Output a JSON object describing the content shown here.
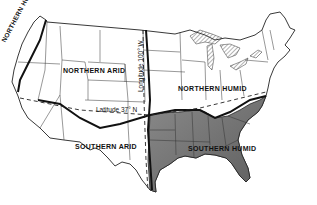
{
  "map": {
    "regions": [
      {
        "name": "Northern Humid",
        "label": "NORTHERN HUMID",
        "position": "Pacific Northwest coast strip"
      },
      {
        "name": "Northern Arid",
        "label": "NORTHERN ARID",
        "position": "north-west interior"
      },
      {
        "name": "Northern Humid",
        "label": "NORTHERN HUMID",
        "position": "north-east"
      },
      {
        "name": "Southern Arid",
        "label": "SOUTHERN ARID",
        "position": "south-west"
      },
      {
        "name": "Southern Humid",
        "label": "SOUTHERN HUMID",
        "position": "south-east (shaded)"
      }
    ],
    "reference_lines": {
      "longitude": "Longitude 100° W",
      "latitude": "Latitude 37° N"
    },
    "colors": {
      "background": "#ffffff",
      "outline": "#222222",
      "southern_humid_fill": "#7a7a7a",
      "lakes_hatch": "#444444"
    }
  }
}
